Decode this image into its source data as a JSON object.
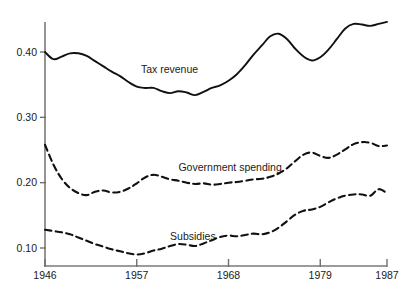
{
  "chart_data": {
    "type": "line",
    "title": "",
    "subtitle": "",
    "xlabel": "",
    "ylabel": "",
    "xlim": [
      1946,
      1987
    ],
    "ylim": [
      0.085,
      0.455
    ],
    "grid": false,
    "legend_position": "inline-annotations",
    "x_tick_labels": [
      "1946",
      "1957",
      "1968",
      "1979",
      "1987"
    ],
    "x_ticks": [
      1946,
      1957,
      1968,
      1979,
      1987
    ],
    "y_tick_labels": [
      "0.40",
      "0.30",
      "0.20",
      "0.10"
    ],
    "y_ticks": [
      0.4,
      0.3,
      0.2,
      0.1
    ],
    "x": [
      1946,
      1947,
      1948,
      1949,
      1950,
      1951,
      1952,
      1953,
      1954,
      1955,
      1956,
      1957,
      1958,
      1959,
      1960,
      1961,
      1962,
      1963,
      1964,
      1965,
      1966,
      1967,
      1968,
      1969,
      1970,
      1971,
      1972,
      1973,
      1974,
      1975,
      1976,
      1977,
      1978,
      1979,
      1980,
      1981,
      1982,
      1983,
      1984,
      1985,
      1986,
      1987
    ],
    "series": [
      {
        "name": "Tax revenue",
        "style": "solid",
        "color": "#111111",
        "label_x": 1957.5,
        "label_y": 0.368,
        "values": [
          0.4,
          0.389,
          0.393,
          0.398,
          0.398,
          0.394,
          0.386,
          0.378,
          0.37,
          0.363,
          0.354,
          0.347,
          0.345,
          0.345,
          0.34,
          0.337,
          0.34,
          0.338,
          0.334,
          0.339,
          0.345,
          0.349,
          0.356,
          0.366,
          0.38,
          0.396,
          0.41,
          0.424,
          0.428,
          0.42,
          0.405,
          0.393,
          0.387,
          0.392,
          0.404,
          0.42,
          0.436,
          0.443,
          0.442,
          0.44,
          0.443,
          0.446
        ]
      },
      {
        "name": "Government spending",
        "style": "dashed",
        "color": "#111111",
        "label_x": 1962.0,
        "label_y": 0.218,
        "values": [
          0.258,
          0.228,
          0.206,
          0.192,
          0.184,
          0.181,
          0.186,
          0.188,
          0.185,
          0.186,
          0.191,
          0.199,
          0.208,
          0.212,
          0.209,
          0.205,
          0.203,
          0.2,
          0.198,
          0.199,
          0.197,
          0.198,
          0.2,
          0.201,
          0.203,
          0.205,
          0.206,
          0.209,
          0.214,
          0.222,
          0.233,
          0.243,
          0.246,
          0.241,
          0.238,
          0.243,
          0.251,
          0.259,
          0.262,
          0.261,
          0.256,
          0.257
        ]
      },
      {
        "name": "Subsidies",
        "style": "dashed",
        "color": "#111111",
        "label_x": 1961.0,
        "label_y": 0.112,
        "values": [
          0.128,
          0.126,
          0.124,
          0.121,
          0.116,
          0.111,
          0.106,
          0.102,
          0.098,
          0.095,
          0.092,
          0.09,
          0.092,
          0.096,
          0.099,
          0.103,
          0.106,
          0.105,
          0.103,
          0.107,
          0.112,
          0.117,
          0.119,
          0.118,
          0.12,
          0.122,
          0.121,
          0.124,
          0.131,
          0.141,
          0.151,
          0.157,
          0.159,
          0.163,
          0.17,
          0.176,
          0.18,
          0.182,
          0.182,
          0.18,
          0.19,
          0.184
        ]
      }
    ]
  },
  "axes": {
    "y_axis_name": "y-axis",
    "x_axis_name": "x-axis"
  }
}
